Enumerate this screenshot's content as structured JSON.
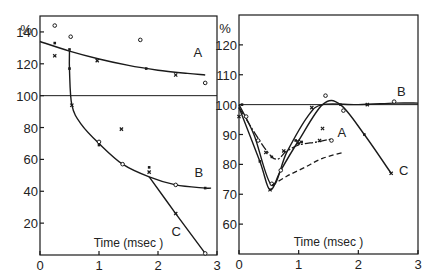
{
  "chart_data": [
    {
      "type": "line",
      "panel": "left",
      "title": "",
      "xlabel": "Time (msec )",
      "ylabel": "%",
      "xlim": [
        0,
        3
      ],
      "ylim": [
        0,
        150
      ],
      "xticks": [
        0,
        1,
        2,
        3
      ],
      "yticks": [
        20,
        40,
        60,
        80,
        100,
        120,
        140
      ],
      "reference_line": 100,
      "grid": false,
      "series": [
        {
          "name": "A",
          "curve": [
            [
              0,
              134
            ],
            [
              0.5,
              128
            ],
            [
              1.0,
              123
            ],
            [
              1.5,
              119
            ],
            [
              2.0,
              116
            ],
            [
              2.5,
              114
            ],
            [
              2.8,
              113
            ]
          ],
          "points": [
            [
              0.25,
              144
            ],
            [
              0.25,
              133
            ],
            [
              0.25,
              125
            ],
            [
              0.52,
              137
            ],
            [
              0.5,
              129
            ],
            [
              0.97,
              122
            ],
            [
              1.7,
              135
            ],
            [
              1.8,
              117
            ],
            [
              2.3,
              113
            ],
            [
              2.8,
              108
            ]
          ]
        },
        {
          "name": "B",
          "curve": [
            [
              0.5,
              128
            ],
            [
              0.5,
              116
            ],
            [
              0.54,
              94
            ],
            [
              0.7,
              82
            ],
            [
              1.0,
              70
            ],
            [
              1.4,
              57
            ],
            [
              1.85,
              49
            ],
            [
              2.3,
              44
            ],
            [
              2.8,
              42
            ],
            [
              2.9,
              42
            ]
          ],
          "points": [
            [
              0.5,
              117
            ],
            [
              0.54,
              94
            ],
            [
              1.0,
              71
            ],
            [
              1.0,
              69
            ],
            [
              1.38,
              79
            ],
            [
              1.4,
              57
            ],
            [
              1.85,
              55
            ],
            [
              1.85,
              52
            ],
            [
              2.3,
              44
            ],
            [
              2.8,
              42
            ]
          ]
        },
        {
          "name": "C",
          "curve": [
            [
              1.85,
              49
            ],
            [
              2.3,
              26
            ],
            [
              2.8,
              1
            ]
          ],
          "points": [
            [
              2.3,
              26
            ],
            [
              2.8,
              1
            ]
          ]
        }
      ],
      "annotations": [
        {
          "text": "A",
          "x": 2.6,
          "y": 124
        },
        {
          "text": "B",
          "x": 2.62,
          "y": 49
        },
        {
          "text": "C",
          "x": 2.23,
          "y": 12
        }
      ]
    },
    {
      "type": "line",
      "panel": "right",
      "title": "",
      "xlabel": "Time (msec )",
      "ylabel": "%",
      "xlim": [
        0,
        3
      ],
      "ylim": [
        50,
        130
      ],
      "xticks": [
        0,
        1,
        2,
        3
      ],
      "yticks": [
        60,
        70,
        80,
        90,
        100,
        110,
        120
      ],
      "reference_line": 100,
      "grid": false,
      "series": [
        {
          "name": "A",
          "style": "dash-dot",
          "curve": [
            [
              0,
              99
            ],
            [
              0.55,
              82.5
            ],
            [
              0.8,
              84.5
            ],
            [
              1.0,
              86.5
            ],
            [
              1.3,
              87.5
            ],
            [
              1.55,
              88.5
            ]
          ],
          "points": [
            [
              0.32,
              88
            ],
            [
              0.55,
              82.5
            ],
            [
              0.75,
              84.5
            ],
            [
              1.0,
              87.5
            ],
            [
              1.05,
              87.5
            ],
            [
              1.35,
              88
            ],
            [
              1.55,
              88
            ]
          ]
        },
        {
          "name": "B",
          "style": "solid",
          "curve": [
            [
              0,
              100
            ],
            [
              0.25,
              90
            ],
            [
              0.55,
              73
            ],
            [
              0.8,
              84
            ],
            [
              1.15,
              96
            ],
            [
              1.4,
              100
            ],
            [
              2.0,
              100
            ],
            [
              2.6,
              100.5
            ],
            [
              3.0,
              100.5
            ]
          ],
          "points": [
            [
              0.05,
              100
            ],
            [
              0.45,
              84
            ],
            [
              0.55,
              73.5
            ],
            [
              1.0,
              87
            ],
            [
              1.22,
              99
            ],
            [
              1.45,
              103
            ],
            [
              1.7,
              100
            ],
            [
              2.15,
              100
            ],
            [
              2.6,
              101
            ]
          ]
        },
        {
          "name": "C",
          "style": "solid",
          "curve": [
            [
              0,
              99
            ],
            [
              0.35,
              81
            ],
            [
              0.52,
              71.5
            ],
            [
              0.7,
              78
            ],
            [
              1.0,
              88
            ],
            [
              1.4,
              100
            ],
            [
              1.7,
              100
            ],
            [
              2.1,
              90
            ],
            [
              2.55,
              77
            ]
          ],
          "points": [
            [
              0,
              96
            ],
            [
              0.12,
              96
            ],
            [
              0.35,
              81
            ],
            [
              0.52,
              71.5
            ],
            [
              0.7,
              78
            ],
            [
              0.95,
              88
            ],
            [
              1.4,
              92
            ],
            [
              1.75,
              98
            ],
            [
              2.1,
              90
            ],
            [
              2.55,
              77
            ]
          ]
        },
        {
          "name": "dashed",
          "style": "dashed",
          "curve": [
            [
              0.55,
              73
            ],
            [
              0.8,
              76
            ],
            [
              1.1,
              79
            ],
            [
              1.4,
              82
            ],
            [
              1.75,
              84
            ]
          ],
          "points": []
        }
      ],
      "annotations": [
        {
          "text": "A",
          "x": 1.65,
          "y": 89
        },
        {
          "text": "B",
          "x": 2.65,
          "y": 103
        },
        {
          "text": "C",
          "x": 2.68,
          "y": 76.5
        }
      ]
    }
  ],
  "labels": {
    "percent_symbol": "%",
    "time_label": "Time (msec )"
  },
  "colors": {
    "ink": "#1a1a1a",
    "background": "#ffffff"
  }
}
